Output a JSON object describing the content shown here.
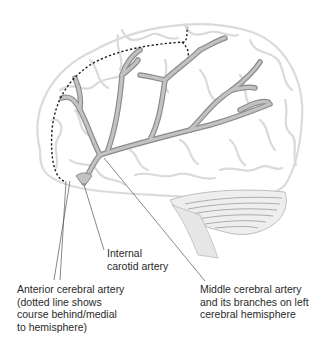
{
  "figure": {
    "colors": {
      "brain_outline": "#d9d9d9",
      "artery_fill": "#b8b8b8",
      "artery_stroke": "#8a8a8a",
      "dotted_line": "#1a1a1a",
      "leader_line": "#555555",
      "label_text": "#2a2a2a",
      "cerebellum": "#9a9a9a"
    }
  },
  "labels": {
    "internal_carotid": "Internal\ncarotid artery",
    "anterior_cerebral": "Anterior cerebral artery\n(dotted line shows\ncourse behind/medial\nto hemisphere)",
    "middle_cerebral": "Middle cerebral artery\nand its branches on left\ncerebral hemisphere"
  }
}
